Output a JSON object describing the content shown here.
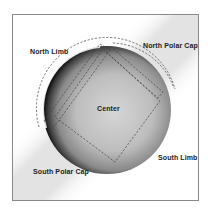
{
  "diagram": {
    "type": "solar-disk-regions",
    "labels": {
      "north_limb": "North Limb",
      "north_polar_cap": "North Polar Cap",
      "center": "Center",
      "south_limb": "South Limb",
      "south_polar_cap": "South Polar Cap"
    },
    "colors": {
      "frame": "#8a8a8a",
      "dash": "#444444",
      "text": "#222222",
      "disk_dark": "#1a1a1a",
      "disk_light": "#d8d8d8"
    }
  }
}
